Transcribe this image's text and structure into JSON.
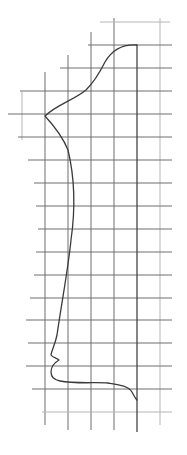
{
  "figure": {
    "grid": {
      "cell_size_px": 23,
      "vertical_lines_x": [
        22,
        45,
        68,
        91,
        114,
        137,
        160
      ],
      "horizontal_lines_y": [
        22,
        45,
        68,
        91,
        114,
        137,
        160,
        183,
        206,
        229,
        252,
        275,
        298,
        320,
        343,
        366,
        389,
        412
      ],
      "line_color": "#6e6e6e"
    },
    "centerline_x": 137,
    "profile_color": "#3a3a3a",
    "profile_path": "M137,45 C122,44 112,50 105,62 C99,74 94,82 86,90 C74,100 56,105 45,116 C56,128 64,140 68,150 C74,175 76,205 71,240 C68,270 62,300 57,335 C55,345 51,352 51,355 C53,358 58,358 59,360 C54,363 51,366 51,372 C51,378 55,380 60,381 C75,384 95,382 108,383 C120,385 128,386 132,392 C134,396 135,398 137,400"
  }
}
